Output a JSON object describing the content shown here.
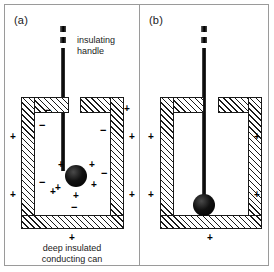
{
  "figure": {
    "background_color": "#ffffff",
    "frame_color": "#9a9a9a",
    "ink_color": "#1a1a1a"
  },
  "panels": [
    {
      "id": "a",
      "label": "(a)",
      "annotations": [
        {
          "id": "insulating-handle",
          "line1": "insulating",
          "line2": "handle"
        }
      ],
      "caption": {
        "line1": "deep insulated",
        "line2": "conducting can"
      },
      "sphere": {
        "charge": "positive",
        "touching_can": false
      },
      "handle": {
        "broken": true,
        "dash_count": 2
      },
      "charges": {
        "sphere_surrounding": [
          "+",
          "+",
          "+",
          "+",
          "+"
        ],
        "can_inner_surface": [
          "−",
          "−",
          "−",
          "−",
          "−",
          "−"
        ],
        "can_outer_surface": [
          "+",
          "+",
          "+",
          "+",
          "+",
          "+",
          "+"
        ]
      }
    },
    {
      "id": "b",
      "label": "(b)",
      "annotations": [],
      "caption": null,
      "sphere": {
        "charge": "neutral",
        "touching_can": true
      },
      "handle": {
        "broken": true,
        "dash_count": 2
      },
      "charges": {
        "sphere_surrounding": [],
        "can_inner_surface": [],
        "can_outer_surface": [
          "+",
          "+",
          "+",
          "+",
          "+"
        ]
      }
    }
  ],
  "signs": {
    "plus": "+",
    "minus": "−"
  }
}
